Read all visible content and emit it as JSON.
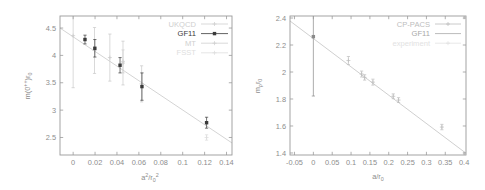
{
  "figure": {
    "background": "#ffffff",
    "axis_color": "#9a9a9a",
    "label_color": "#8d8d8d"
  },
  "chart_data": [
    {
      "id": "glueball-scaling",
      "type": "scatter",
      "title": "",
      "xlabel": "a^2/r_0^2",
      "ylabel": "m(0^{++})r_0",
      "xlim": [
        -0.012,
        0.145
      ],
      "ylim": [
        2.18,
        4.72
      ],
      "xticks": [
        0,
        0.02,
        0.04,
        0.06,
        0.08,
        0.1,
        0.12,
        0.14
      ],
      "xticklabels": [
        "0",
        "0.02",
        "0.04",
        "0.06",
        "0.08",
        "0.1",
        "0.12",
        "0.14"
      ],
      "yticks": [
        2.5,
        3,
        3.5,
        4,
        4.5
      ],
      "yticklabels": [
        "2.5",
        "3",
        "3.5",
        "4",
        "4.5"
      ],
      "grid": false,
      "legend_position": "top-right",
      "series": [
        {
          "name": "UKQCD",
          "color": "#c9c9c9",
          "marker": "plus",
          "points": [
            {
              "x": 0.0,
              "y": 4.36,
              "yerr": 0.95
            },
            {
              "x": 0.0195,
              "y": 4.09,
              "yerr": 0.42
            },
            {
              "x": 0.0335,
              "y": 3.96,
              "yerr": 0.43
            },
            {
              "x": 0.0455,
              "y": 3.86,
              "yerr": 0.4
            },
            {
              "x": 0.0625,
              "y": 3.48,
              "yerr": 0.33
            }
          ]
        },
        {
          "name": "GF11",
          "color": "#3a3a3a",
          "marker": "square",
          "points": [
            {
              "x": 0.0108,
              "y": 4.29,
              "yerr": 0.08
            },
            {
              "x": 0.0198,
              "y": 4.13,
              "yerr": 0.16
            },
            {
              "x": 0.0428,
              "y": 3.82,
              "yerr": 0.14
            },
            {
              "x": 0.0628,
              "y": 3.43,
              "yerr": 0.25
            },
            {
              "x": 0.1218,
              "y": 2.77,
              "yerr": 0.1
            }
          ]
        },
        {
          "name": "MT",
          "color": "#cfcfcf",
          "marker": "plus",
          "points": [
            {
              "x": 0.0455,
              "y": 3.89,
              "yerr": 0.21
            }
          ]
        },
        {
          "name": "FSST",
          "color": "#dcdcdc",
          "marker": "plus",
          "points": [
            {
              "x": 0.1218,
              "y": 2.5,
              "yerr": 0.05
            }
          ]
        }
      ],
      "fit": {
        "name": "linear-fit",
        "color": "#cccccc",
        "x_start": -0.012,
        "y_start": 4.5,
        "x_end": 0.145,
        "y_end": 2.4
      },
      "legend_entries": [
        {
          "label": "UKQCD",
          "color": "#cfcfcf",
          "marker": "plus",
          "has_line": true
        },
        {
          "label": "GF11",
          "color": "#3a3a3a",
          "marker": "square",
          "has_line": true
        },
        {
          "label": "MT",
          "color": "#cfcfcf",
          "marker": "plus",
          "has_line": true
        },
        {
          "label": "FSST",
          "color": "#dedede",
          "marker": "plus",
          "has_line": true
        }
      ]
    },
    {
      "id": "rho-mass-scaling",
      "type": "scatter",
      "title": "",
      "xlabel": "a/r_0",
      "ylabel": "m_rho r_0",
      "xlim": [
        -0.062,
        0.405
      ],
      "ylim": [
        1.385,
        2.415
      ],
      "xticks": [
        -0.05,
        0,
        0.05,
        0.1,
        0.15,
        0.2,
        0.25,
        0.3,
        0.35,
        0.4
      ],
      "xticklabels": [
        "-0.05",
        "0",
        "0.05",
        "0.1",
        "0.15",
        "0.2",
        "0.25",
        "0.3",
        "0.35",
        "0.4"
      ],
      "yticks": [
        1.4,
        1.6,
        1.8,
        2.0,
        2.2,
        2.4
      ],
      "yticklabels": [
        "1.4",
        "1.6",
        "1.8",
        "2",
        "2.2",
        "2.4"
      ],
      "grid": false,
      "legend_position": "top-right",
      "series": [
        {
          "name": "CP-PACS",
          "color": "#bdbdbd",
          "marker": "plus",
          "points": [
            {
              "x": 0.093,
              "y": 2.085,
              "yerr": 0.03
            },
            {
              "x": 0.128,
              "y": 1.985,
              "yerr": 0.022
            },
            {
              "x": 0.136,
              "y": 1.96,
              "yerr": 0.02
            },
            {
              "x": 0.158,
              "y": 1.925,
              "yerr": 0.022
            },
            {
              "x": 0.212,
              "y": 1.82,
              "yerr": 0.018
            },
            {
              "x": 0.226,
              "y": 1.792,
              "yerr": 0.018
            },
            {
              "x": 0.341,
              "y": 1.592,
              "yerr": 0.02
            }
          ]
        },
        {
          "name": "GF11",
          "color": "#8a8a8a",
          "marker": "square",
          "points": [
            {
              "x": 0.0,
              "y": 2.262,
              "yerr": 0.44
            }
          ]
        },
        {
          "name": "experiment",
          "color": "#e0e0e0",
          "marker": "plus",
          "points": []
        }
      ],
      "fit": {
        "name": "linear-fit",
        "color": "#c6c6c6",
        "x_start": -0.062,
        "y_start": 2.378,
        "x_end": 0.405,
        "y_end": 1.398
      },
      "legend_entries": [
        {
          "label": "CP-PACS",
          "color": "#bdbdbd",
          "marker": "plus",
          "has_line": true
        },
        {
          "label": "GF11",
          "color": "#a8a8a8",
          "marker": "line",
          "has_line": true
        },
        {
          "label": "experiment",
          "color": "#e2e2e2",
          "marker": "plus",
          "has_line": true
        }
      ]
    }
  ]
}
